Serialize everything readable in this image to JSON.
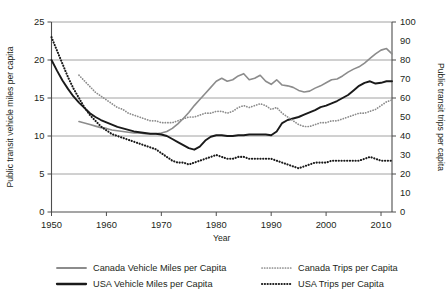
{
  "chart_data": {
    "type": "line",
    "title": "",
    "xlabel": "Year",
    "ylabel": "Public transit vehicle miles per capita",
    "y2label": "Public transit trips per capita",
    "xlim": [
      1950,
      2012
    ],
    "ylim": [
      0,
      25
    ],
    "y2lim": [
      0,
      100
    ],
    "xticks": [
      1950,
      1960,
      1970,
      1980,
      1990,
      2000,
      2010
    ],
    "yticks": [
      0,
      5,
      10,
      15,
      20,
      25
    ],
    "y2ticks": [
      0,
      10,
      20,
      30,
      40,
      50,
      60,
      70,
      80,
      90,
      100
    ],
    "y2_major_ticks": [
      0,
      20,
      40,
      60,
      80,
      100
    ],
    "grid": "horizontal",
    "legend_position": "bottom",
    "colors": {
      "canada": "#8c8c8c",
      "usa": "#1a1a1a",
      "gridline": "#8a8a8a",
      "axis": "#4d4d4d",
      "text": "#231f20",
      "background": "#ffffff"
    },
    "series": [
      {
        "name": "Canada Vehicle Miles per Capita",
        "axis": "left",
        "style": "solid",
        "color": "#8c8c8c",
        "x": [
          1955,
          1956,
          1957,
          1958,
          1959,
          1960,
          1961,
          1962,
          1963,
          1964,
          1965,
          1966,
          1967,
          1968,
          1969,
          1970,
          1971,
          1972,
          1973,
          1974,
          1975,
          1976,
          1977,
          1978,
          1979,
          1980,
          1981,
          1982,
          1983,
          1984,
          1985,
          1986,
          1987,
          1988,
          1989,
          1990,
          1991,
          1992,
          1993,
          1994,
          1995,
          1996,
          1997,
          1998,
          1999,
          2000,
          2001,
          2002,
          2003,
          2004,
          2005,
          2006,
          2007,
          2008,
          2009,
          2010,
          2011,
          2012
        ],
        "y": [
          11.9,
          11.7,
          11.5,
          11.3,
          11.1,
          11.0,
          10.8,
          10.7,
          10.6,
          10.5,
          10.4,
          10.4,
          10.3,
          10.3,
          10.3,
          10.4,
          10.6,
          11.0,
          11.6,
          12.3,
          13.1,
          14.0,
          14.8,
          15.6,
          16.4,
          17.2,
          17.6,
          17.2,
          17.4,
          17.9,
          18.2,
          17.4,
          17.6,
          18.0,
          17.2,
          16.8,
          17.4,
          16.7,
          16.6,
          16.4,
          16.0,
          15.8,
          15.9,
          16.3,
          16.6,
          17.0,
          17.4,
          17.5,
          17.9,
          18.4,
          18.8,
          19.1,
          19.6,
          20.2,
          20.8,
          21.3,
          21.5,
          20.8
        ]
      },
      {
        "name": "USA Vehicle Miles per Capita",
        "axis": "left",
        "style": "solid",
        "color": "#1a1a1a",
        "x": [
          1950,
          1951,
          1952,
          1953,
          1954,
          1955,
          1956,
          1957,
          1958,
          1959,
          1960,
          1961,
          1962,
          1963,
          1964,
          1965,
          1966,
          1967,
          1968,
          1969,
          1970,
          1971,
          1972,
          1973,
          1974,
          1975,
          1976,
          1977,
          1978,
          1979,
          1980,
          1981,
          1982,
          1983,
          1984,
          1985,
          1986,
          1987,
          1988,
          1989,
          1990,
          1991,
          1992,
          1993,
          1994,
          1995,
          1996,
          1997,
          1998,
          1999,
          2000,
          2001,
          2002,
          2003,
          2004,
          2005,
          2006,
          2007,
          2008,
          2009,
          2010,
          2011,
          2012
        ],
        "y": [
          20.0,
          18.6,
          17.3,
          16.2,
          15.2,
          14.4,
          13.7,
          13.0,
          12.5,
          12.1,
          11.8,
          11.5,
          11.2,
          11.0,
          10.8,
          10.6,
          10.5,
          10.4,
          10.3,
          10.3,
          10.2,
          10.0,
          9.6,
          9.2,
          8.8,
          8.4,
          8.2,
          8.6,
          9.4,
          9.9,
          10.1,
          10.1,
          10.0,
          10.0,
          10.1,
          10.1,
          10.2,
          10.2,
          10.2,
          10.2,
          10.1,
          10.6,
          11.7,
          12.1,
          12.3,
          12.5,
          12.8,
          13.1,
          13.4,
          13.8,
          14.0,
          14.3,
          14.6,
          15.0,
          15.4,
          16.0,
          16.6,
          17.0,
          17.2,
          16.9,
          17.0,
          17.2,
          17.2
        ]
      },
      {
        "name": "Canada Trips per Capita",
        "axis": "right",
        "style": "dotted",
        "color": "#8c8c8c",
        "x": [
          1955,
          1956,
          1957,
          1958,
          1959,
          1960,
          1961,
          1962,
          1963,
          1964,
          1965,
          1966,
          1967,
          1968,
          1969,
          1970,
          1971,
          1972,
          1973,
          1974,
          1975,
          1976,
          1977,
          1978,
          1979,
          1980,
          1981,
          1982,
          1983,
          1984,
          1985,
          1986,
          1987,
          1988,
          1989,
          1990,
          1991,
          1992,
          1993,
          1994,
          1995,
          1996,
          1997,
          1998,
          1999,
          2000,
          2001,
          2002,
          2003,
          2004,
          2005,
          2006,
          2007,
          2008,
          2009,
          2010,
          2011,
          2012
        ],
        "y": [
          72,
          69,
          66,
          63,
          61,
          59,
          57,
          55,
          54,
          52,
          51,
          50,
          49,
          48,
          48,
          47,
          47,
          47,
          48,
          49,
          50,
          50,
          51,
          52,
          52,
          53,
          53,
          52,
          53,
          55,
          56,
          55,
          56,
          57,
          56,
          54,
          55,
          52,
          50,
          48,
          46,
          45,
          45,
          46,
          47,
          47,
          48,
          48,
          49,
          50,
          51,
          52,
          52,
          53,
          54,
          56,
          58,
          59
        ]
      },
      {
        "name": "USA Trips per Capita",
        "axis": "right",
        "style": "dotted",
        "color": "#1a1a1a",
        "x": [
          1950,
          1951,
          1952,
          1953,
          1954,
          1955,
          1956,
          1957,
          1958,
          1959,
          1960,
          1961,
          1962,
          1963,
          1964,
          1965,
          1966,
          1967,
          1968,
          1969,
          1970,
          1971,
          1972,
          1973,
          1974,
          1975,
          1976,
          1977,
          1978,
          1979,
          1980,
          1981,
          1982,
          1983,
          1984,
          1985,
          1986,
          1987,
          1988,
          1989,
          1990,
          1991,
          1992,
          1993,
          1994,
          1995,
          1996,
          1997,
          1998,
          1999,
          2000,
          2001,
          2002,
          2003,
          2004,
          2005,
          2006,
          2007,
          2008,
          2009,
          2010,
          2011,
          2012
        ],
        "y": [
          92,
          85,
          78,
          71,
          65,
          60,
          55,
          51,
          48,
          45,
          43,
          41,
          40,
          39,
          38,
          37,
          36,
          35,
          34,
          33,
          31,
          29,
          27,
          26,
          26,
          25,
          26,
          27,
          28,
          29,
          30,
          29,
          28,
          28,
          29,
          29,
          28,
          28,
          28,
          28,
          28,
          27,
          26,
          25,
          24,
          23,
          24,
          25,
          26,
          26,
          26,
          27,
          27,
          27,
          27,
          27,
          27,
          28,
          29,
          28,
          27,
          27,
          27
        ]
      }
    ],
    "legend": [
      {
        "label": "Canada Vehicle Miles per Capita",
        "color": "#8c8c8c",
        "style": "solid"
      },
      {
        "label": "USA Vehicle Miles per Capita",
        "color": "#1a1a1a",
        "style": "solid"
      },
      {
        "label": "Canada Trips per Capita",
        "color": "#8c8c8c",
        "style": "dotted"
      },
      {
        "label": "USA Trips per Capita",
        "color": "#1a1a1a",
        "style": "dotted"
      }
    ]
  }
}
